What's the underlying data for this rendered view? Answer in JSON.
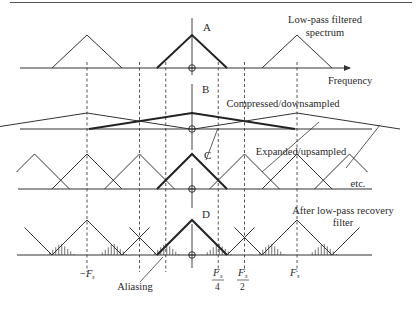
{
  "figure": {
    "rows": [
      {
        "id": "A",
        "label": "A",
        "description": "Low-pass filtered\nspectrum",
        "desc_lines": [
          "Low-pass filtered",
          "spectrum"
        ]
      },
      {
        "id": "B",
        "label": "B",
        "description": "Compressed/downsampled",
        "desc_lines": [
          "Compressed/downsampled"
        ]
      },
      {
        "id": "C",
        "label": "C",
        "description": "Expanded/upsampled",
        "desc_lines": [
          "Expanded/upsampled"
        ],
        "trailing": "etc."
      },
      {
        "id": "D",
        "label": "D",
        "description": "After low-pass recovery filter",
        "desc_lines": [
          "After low-pass recovery",
          "filter"
        ]
      }
    ],
    "axis_label": "Frequency",
    "annotation": "Aliasing",
    "ticks": [
      {
        "id": "neg-fs",
        "text": "−F",
        "sub": "s",
        "frac": null
      },
      {
        "id": "fs-4",
        "text": "F",
        "sub": "s",
        "den": "4"
      },
      {
        "id": "fs-2",
        "text": "F",
        "sub": "s",
        "den": "2"
      },
      {
        "id": "fs",
        "text": "F",
        "sub": "s",
        "frac": null
      }
    ]
  },
  "chart_data": {
    "type": "diagram",
    "title": "",
    "xlabel": "Frequency",
    "frequency_markers": [
      "-Fs",
      "Fs/4",
      "Fs/2",
      "Fs"
    ],
    "panels": [
      {
        "id": "A",
        "name": "Low-pass filtered spectrum",
        "spectral_copies_at": [
          "-Fs",
          "0",
          "Fs"
        ],
        "bandwidth": "Fs/4"
      },
      {
        "id": "B",
        "name": "Compressed/downsampled",
        "spectral_copies_at": [
          "-Fs",
          "0",
          "Fs"
        ],
        "bandwidth": "Fs/2 (overlapping)"
      },
      {
        "id": "C",
        "name": "Expanded/upsampled",
        "spectral_copies_at": [
          "-3Fs/2",
          "-Fs",
          "-Fs/2",
          "0",
          "Fs/2",
          "Fs",
          "3Fs/2"
        ],
        "note": "etc."
      },
      {
        "id": "D",
        "name": "After low-pass recovery filter",
        "spectral_copies_at": [
          "-Fs",
          "0",
          "Fs"
        ],
        "annotation": "Aliasing (hatched overlap regions)"
      }
    ]
  }
}
